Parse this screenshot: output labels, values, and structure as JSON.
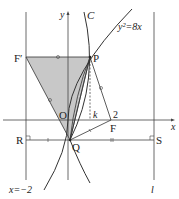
{
  "header_fragment": "",
  "labels": {
    "y_axis": "y",
    "x_axis": "x",
    "curve_c": "C",
    "parabola_eq": "y²=8x",
    "f_prime": "F′",
    "p": "P",
    "o": "O",
    "k": "k",
    "two": "2",
    "f": "F",
    "r": "R",
    "q": "Q",
    "s": "S",
    "directrix": "x=−2",
    "line_l": "l"
  },
  "colors": {
    "line": "#333333",
    "shade": "#c8c8c8",
    "background": "#ffffff"
  }
}
